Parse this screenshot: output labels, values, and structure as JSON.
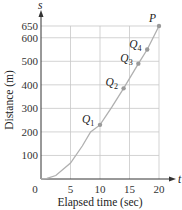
{
  "chart_data": {
    "type": "line",
    "title": "",
    "xlabel": "Elapsed time (sec)",
    "ylabel": "Distance (m)",
    "x_axis_symbol": "t",
    "y_axis_symbol": "s",
    "xlim": [
      0,
      22
    ],
    "ylim": [
      0,
      690
    ],
    "x_ticks": [
      0,
      5,
      10,
      15,
      20
    ],
    "x_tick_labels": [
      "0",
      "5",
      "10",
      "15",
      "20"
    ],
    "y_ticks": [
      100,
      200,
      300,
      400,
      500,
      600,
      650
    ],
    "y_tick_labels": [
      "100",
      "200",
      "300",
      "400",
      "500",
      "600",
      "650"
    ],
    "grid": true,
    "series": [
      {
        "name": "distance curve",
        "x": [
          0,
          1,
          2.5,
          5,
          7,
          8.4,
          10,
          12,
          14,
          16.5,
          18,
          20
        ],
        "y": [
          0,
          3,
          15,
          68,
          140,
          200,
          230,
          305,
          385,
          490,
          550,
          650
        ]
      }
    ],
    "points": [
      {
        "label": "Q",
        "sub": "1",
        "t": 10,
        "s": 230
      },
      {
        "label": "Q",
        "sub": "2",
        "t": 14,
        "s": 385
      },
      {
        "label": "Q",
        "sub": "3",
        "t": 16.5,
        "s": 490
      },
      {
        "label": "Q",
        "sub": "4",
        "t": 18,
        "s": 550
      },
      {
        "label": "P",
        "sub": "",
        "t": 20,
        "s": 650
      }
    ],
    "colors": {
      "axis": "#333333",
      "grid": "#c8c8c8",
      "curve": "#b0b0b0",
      "point": "#9a9a9a"
    }
  }
}
